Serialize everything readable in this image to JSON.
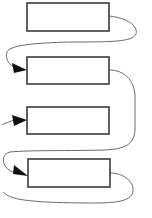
{
  "diagram": {
    "type": "flow",
    "colors": {
      "background": "#ffffff",
      "box_stroke": "#3a3a3a",
      "connector_stroke": "#6a6a6a",
      "arrowhead_fill": "#111111"
    },
    "boxes": [
      {
        "id": "box-1",
        "label": "",
        "x": 27,
        "y": 3,
        "width": 82,
        "height": 28
      },
      {
        "id": "box-2",
        "label": "",
        "x": 27,
        "y": 57,
        "width": 82,
        "height": 27
      },
      {
        "id": "box-3",
        "label": "",
        "x": 27,
        "y": 107,
        "width": 82,
        "height": 27
      },
      {
        "id": "box-4",
        "label": "",
        "x": 28,
        "y": 159,
        "width": 82,
        "height": 28
      }
    ],
    "connectors": [
      {
        "id": "connector-1-to-2",
        "from": "box-1",
        "to": "box-2",
        "arrow": true
      },
      {
        "id": "connector-2-to-4",
        "from": "box-2",
        "to": "box-4",
        "arrow": true
      },
      {
        "id": "connector-in-to-3",
        "from": "left-edge",
        "to": "box-3",
        "arrow": true
      },
      {
        "id": "connector-4-out",
        "from": "box-4",
        "to": "left-edge",
        "arrow": false
      }
    ]
  }
}
